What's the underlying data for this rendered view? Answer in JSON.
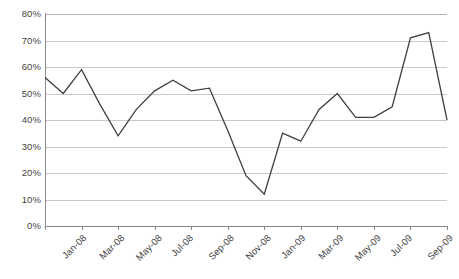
{
  "chart_data": {
    "type": "line",
    "title": "",
    "subtitle": "",
    "xlabel": "",
    "ylabel": "",
    "ylim": [
      0,
      80
    ],
    "y_tick_labels": [
      "0%",
      "10%",
      "20%",
      "30%",
      "40%",
      "50%",
      "60%",
      "70%",
      "80%"
    ],
    "y_tick_values": [
      0,
      10,
      20,
      30,
      40,
      50,
      60,
      70,
      80
    ],
    "grid": true,
    "legend": false,
    "legend_position": "none",
    "line_color": "#404040",
    "gridline_color": "#c9c9c9",
    "axis_color": "#8a8a8a",
    "x_tick_labels": [
      "Jan-08",
      "Mar-08",
      "May-08",
      "Jul-08",
      "Sep-08",
      "Nov-08",
      "Jan-09",
      "Mar-09",
      "May-09",
      "Jul-09",
      "Sep-09",
      "Nov-09"
    ],
    "x": [
      "Jan-08",
      "Feb-08",
      "Mar-08",
      "Apr-08",
      "May-08",
      "Jun-08",
      "Jul-08",
      "Aug-08",
      "Sep-08",
      "Oct-08",
      "Nov-08",
      "Dec-08",
      "Jan-09",
      "Feb-09",
      "Mar-09",
      "Apr-09",
      "May-09",
      "Jun-09",
      "Jul-09",
      "Aug-09",
      "Sep-09",
      "Oct-09",
      "Nov-09"
    ],
    "values": [
      56,
      50,
      59,
      46,
      34,
      44,
      51,
      55,
      51,
      52,
      36,
      19,
      12,
      35,
      32,
      44,
      50,
      41,
      41,
      45,
      71,
      73,
      40
    ]
  },
  "axes": {
    "y_unit": "%",
    "x_label_rotation": "-45"
  }
}
